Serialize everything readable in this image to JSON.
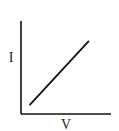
{
  "diagram": {
    "type": "line",
    "title": "",
    "xlabel": "V",
    "ylabel": "I",
    "colors": {
      "axis": "#111111",
      "line": "#111111",
      "text": "#222222"
    },
    "relationship": "linear-proportional",
    "series": [
      {
        "name": "I vs V",
        "points": [
          [
            0.1,
            0.1
          ],
          [
            0.75,
            0.78
          ]
        ]
      }
    ],
    "xlim": [
      0,
      1
    ],
    "ylim": [
      0,
      1
    ]
  }
}
